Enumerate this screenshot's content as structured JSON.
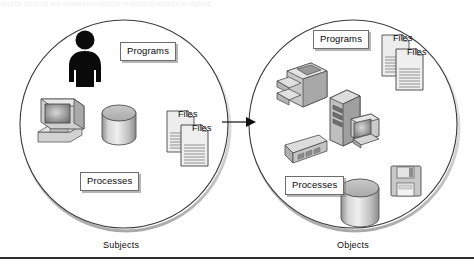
{
  "figure": {
    "type": "venn-like-two-circle-diagram",
    "background": "#ffffff",
    "stroke_color": "#3a3a3a",
    "plate_fill": "#fdfdfd",
    "plate_border": "#6d6d6d",
    "shadow_color": "#787878",
    "icon_gray_light": "#e3e3e3",
    "icon_gray_mid": "#b4b4b4",
    "icon_gray_dark": "#7d7d7d",
    "person_color": "#0a0a0a",
    "top_cropped_text": "access controls are applied to subjects requesting access to objects"
  },
  "captions": {
    "left": "Subjects",
    "right": "Objects"
  },
  "flow": {
    "arrow_label": "",
    "direction": "left-to-right",
    "from": "Subjects",
    "to": "Objects"
  },
  "subjects_circle": {
    "caption": "Subjects",
    "center": {
      "x": 124,
      "y": 124
    },
    "radius": 104,
    "plates": [
      {
        "id": "programs",
        "label": "Programs",
        "x": 120,
        "y": 42
      },
      {
        "id": "processes",
        "label": "Processes",
        "x": 80,
        "y": 172
      }
    ],
    "icons": [
      {
        "id": "person",
        "name": "person-icon",
        "x": 66,
        "y": 30
      },
      {
        "id": "workstation",
        "name": "computer-icon",
        "x": 36,
        "y": 96
      },
      {
        "id": "database",
        "name": "database-cylinder-icon",
        "x": 101,
        "y": 104
      },
      {
        "id": "files",
        "name": "files-documents-icon",
        "x": 167,
        "y": 108,
        "labels": [
          "Files",
          "Files"
        ]
      }
    ]
  },
  "objects_circle": {
    "caption": "Objects",
    "center": {
      "x": 353,
      "y": 124
    },
    "radius": 104,
    "plates": [
      {
        "id": "programs",
        "label": "Programs",
        "x": 313,
        "y": 30
      },
      {
        "id": "processes",
        "label": "Processes",
        "x": 285,
        "y": 176
      }
    ],
    "icons": [
      {
        "id": "printer",
        "name": "printer-icon",
        "x": 277,
        "y": 57
      },
      {
        "id": "files",
        "name": "files-documents-icon",
        "x": 382,
        "y": 32,
        "labels": [
          "Files",
          "Files"
        ]
      },
      {
        "id": "server",
        "name": "server-tower-icon",
        "x": 327,
        "y": 86
      },
      {
        "id": "cartridge",
        "name": "tape-cartridge-icon",
        "x": 283,
        "y": 135
      },
      {
        "id": "database",
        "name": "database-cylinder-icon",
        "x": 340,
        "y": 178
      },
      {
        "id": "floppy",
        "name": "floppy-disk-icon",
        "x": 390,
        "y": 165
      }
    ]
  }
}
